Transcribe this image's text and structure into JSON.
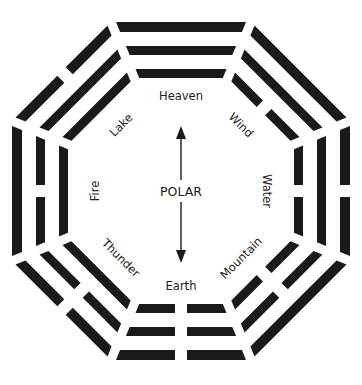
{
  "diagram": {
    "center_label": "POLAR",
    "geometry": {
      "cx": 181,
      "cy": 191,
      "rings": [
        {
          "inner": 159,
          "outer": 169
        },
        {
          "inner": 136,
          "outer": 145
        },
        {
          "inner": 113,
          "outer": 122
        }
      ],
      "gap": 5,
      "break_gap": 12
    },
    "trigrams": [
      {
        "name": "Heaven",
        "angle": -90,
        "lines_outer_to_inner": [
          "solid",
          "solid",
          "solid"
        ]
      },
      {
        "name": "Wind",
        "angle": -45,
        "lines_outer_to_inner": [
          "solid",
          "solid",
          "broken"
        ]
      },
      {
        "name": "Water",
        "angle": 0,
        "lines_outer_to_inner": [
          "broken",
          "solid",
          "broken"
        ]
      },
      {
        "name": "Mountain",
        "angle": 45,
        "lines_outer_to_inner": [
          "solid",
          "broken",
          "broken"
        ]
      },
      {
        "name": "Earth",
        "angle": 90,
        "lines_outer_to_inner": [
          "broken",
          "broken",
          "broken"
        ]
      },
      {
        "name": "Thunder",
        "angle": 135,
        "lines_outer_to_inner": [
          "broken",
          "broken",
          "solid"
        ]
      },
      {
        "name": "Fire",
        "angle": 180,
        "lines_outer_to_inner": [
          "solid",
          "broken",
          "solid"
        ]
      },
      {
        "name": "Lake",
        "angle": -135,
        "lines_outer_to_inner": [
          "broken",
          "solid",
          "solid"
        ]
      }
    ],
    "labels": {
      "heaven": "Heaven",
      "wind": "Wind",
      "water": "Water",
      "mountain": "Mountain",
      "earth": "Earth",
      "thunder": "Thunder",
      "fire": "Fire",
      "lake": "Lake"
    },
    "arrow": {
      "direction": "bidirectional-vertical",
      "top_y": 124,
      "bottom_y": 264
    },
    "colors": {
      "ink": "#1a1a1a",
      "background": "#ffffff"
    }
  }
}
